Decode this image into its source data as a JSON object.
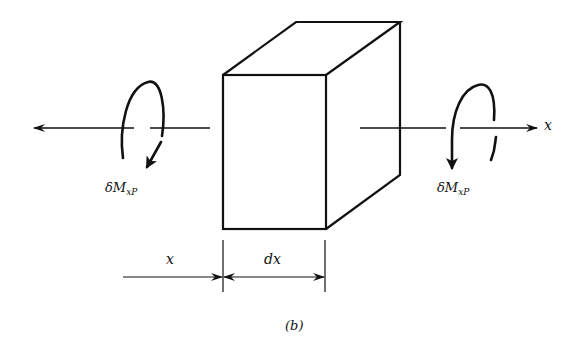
{
  "diagram": {
    "type": "free-body element",
    "element": "rectangular prism of length dx",
    "labels": {
      "left_moment": {
        "main": "δM",
        "sub": "xP"
      },
      "right_moment": {
        "main": "δM",
        "sub": "xP"
      },
      "axis": "x",
      "dim_x": "x",
      "dim_dx": "dx",
      "caption": "(b)"
    },
    "colors": {
      "stroke": "#111111",
      "background": "#ffffff"
    }
  }
}
